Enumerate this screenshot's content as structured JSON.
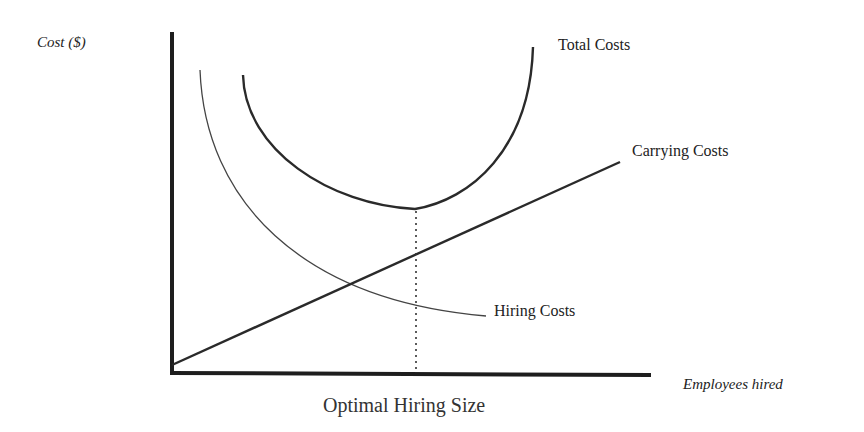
{
  "diagram": {
    "title": "Optimal Hiring Size",
    "y_axis_label": "Cost ($)",
    "x_axis_label": "Employees hired",
    "curves": [
      {
        "name": "Total Costs",
        "shape": "U-shaped",
        "stroke": "#2a2a2a"
      },
      {
        "name": "Carrying Costs",
        "shape": "straight line rising from origin",
        "stroke": "#2a2a2a"
      },
      {
        "name": "Hiring Costs",
        "shape": "decreasing convex curve",
        "stroke": "#444444"
      }
    ],
    "annotation": {
      "type": "dotted vertical line",
      "description": "from Total Costs minimum down to x-axis",
      "label": "Optimal Hiring Size"
    },
    "colors": {
      "background": "#ffffff",
      "ink": "#222222"
    }
  },
  "labels": {
    "y_axis": "Cost ($)",
    "x_axis": "Employees hired",
    "total_costs": "Total Costs",
    "carrying_costs": "Carrying Costs",
    "hiring_costs": "Hiring Costs",
    "optimal": "Optimal Hiring Size"
  }
}
